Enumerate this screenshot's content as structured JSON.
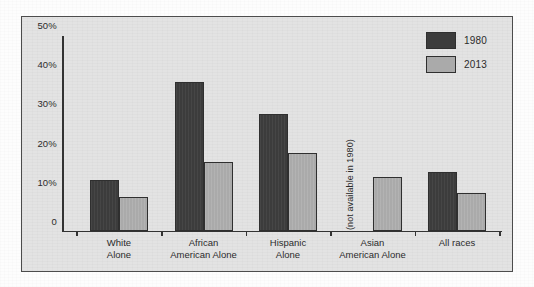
{
  "chart_data": {
    "type": "bar",
    "title": "",
    "xlabel": "",
    "ylabel": "",
    "ylim": [
      0,
      50
    ],
    "grid": false,
    "legend_position": "top-right",
    "categories": [
      "White Alone",
      "African American Alone",
      "Hispanic Alone",
      "Asian American Alone",
      "All races"
    ],
    "category_lines": [
      [
        "White",
        "Alone"
      ],
      [
        "African",
        "American Alone"
      ],
      [
        "Hispanic",
        "Alone"
      ],
      [
        "Asian",
        "American Alone"
      ],
      [
        "All races",
        ""
      ]
    ],
    "series": [
      {
        "name": "1980",
        "color": "#3c3c3c",
        "values": [
          13.0,
          38.0,
          29.7,
          null,
          15.0
        ]
      },
      {
        "name": "2013",
        "color": "#aaaaaa",
        "values": [
          8.6,
          17.6,
          19.8,
          13.7,
          9.6
        ]
      }
    ],
    "ytick_labels": [
      "0",
      "10%",
      "20%",
      "30%",
      "40%",
      "50%"
    ],
    "ytick_values": [
      0,
      10,
      20,
      30,
      40,
      50
    ],
    "annotations": [
      {
        "text": "(not available in 1980)",
        "category": "Asian American Alone",
        "series": "1980",
        "orientation": "vertical"
      }
    ]
  },
  "legend": {
    "items": [
      {
        "label": "1980",
        "swatch": "dark-swatch"
      },
      {
        "label": "2013",
        "swatch": "light-swatch"
      }
    ]
  }
}
